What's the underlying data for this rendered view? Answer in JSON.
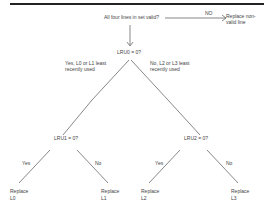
{
  "diagram": {
    "title_question": "All four lines in set valid?",
    "no_branch_label": "NO",
    "replace_non_valid": "Replace non-valid line",
    "root": {
      "question": "LRU0 = 0?",
      "yes_label": "Yes, L0 or L1 least recently used",
      "no_label": "No, L2 or L3 least recently used"
    },
    "left_node": {
      "question": "LRU1 = 0?",
      "yes_label": "Yes",
      "no_label": "No",
      "leaf_yes_line1": "Replace",
      "leaf_yes_line2": "L0",
      "leaf_no_line1": "Replace",
      "leaf_no_line2": "L1"
    },
    "right_node": {
      "question": "LRU2 = 0?",
      "yes_label": "Yes",
      "no_label": "No",
      "leaf_yes_line1": "Replace",
      "leaf_yes_line2": "L2",
      "leaf_no_line1": "Replace",
      "leaf_no_line2": "L3"
    }
  }
}
